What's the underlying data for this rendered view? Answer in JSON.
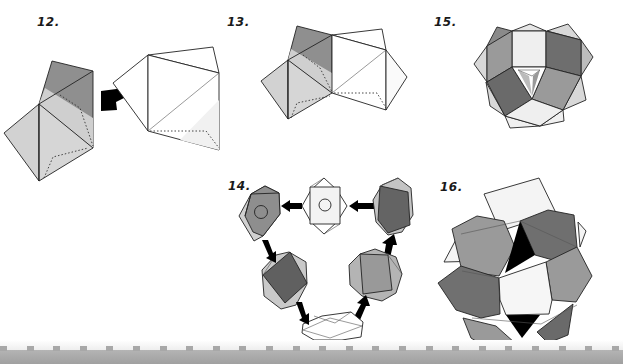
{
  "figures": [
    {
      "id": "12",
      "label": "12.",
      "description": "Two origami units joined; left unit shaded, right unit white, arrow pointing left"
    },
    {
      "id": "13",
      "label": "13.",
      "description": "Units joined along shared edge"
    },
    {
      "id": "15",
      "label": "15.",
      "description": "Partially assembled polyhedron ring"
    },
    {
      "id": "14",
      "label": "14.",
      "description": "Cycle of six units connected by arrows"
    },
    {
      "id": "16",
      "label": "16.",
      "description": "Completed modular origami polyhedron"
    }
  ],
  "colors": {
    "light": "#d2d2d2",
    "lighter": "#e6e6e6",
    "mid": "#9a9a9a",
    "dark": "#6e6e6e",
    "black": "#000000",
    "white": "#ffffff",
    "line": "#222222",
    "band": "#a8a8a8"
  },
  "footer": {
    "tab_count": 24,
    "tab_spacing": 26.6
  }
}
